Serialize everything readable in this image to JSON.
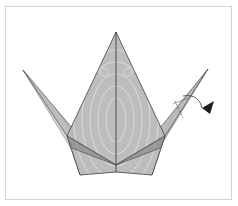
{
  "diagram": {
    "colors": {
      "paper_fill": "#b9b9b9",
      "paper_light": "#d6d6d6",
      "paper_dark": "#8f8f8f",
      "edge": "#555555",
      "arrow": "#222222",
      "frame_border": "#d4d4d4",
      "background": "#ffffff"
    },
    "points": {
      "top_tip": [
        116,
        32
      ],
      "left_wing_tip": [
        23,
        70
      ],
      "right_wing_tip": [
        208,
        69
      ],
      "left_shoulder": [
        67,
        136
      ],
      "right_shoulder": [
        165,
        136
      ],
      "bottom_left": [
        80,
        175
      ],
      "bottom_right": [
        152,
        175
      ],
      "bottom_center": [
        116,
        170
      ],
      "center_point": [
        116,
        165
      ]
    },
    "annotations": [
      {
        "type": "fold-arrow",
        "label": "inside reverse fold (head)",
        "target": "right_wing_tip"
      },
      {
        "type": "fold-line",
        "label": "fold line on right point"
      }
    ]
  }
}
